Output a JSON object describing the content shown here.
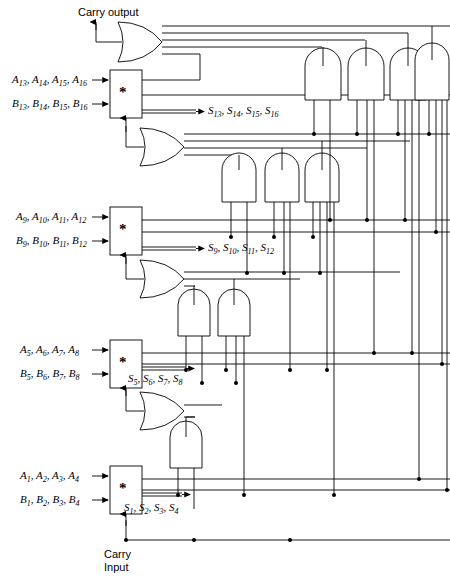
{
  "diagram": {
    "carry_output_label": "Carry output",
    "carry_input_label": "Carry\nInput",
    "carry_input_line1": "Carry",
    "carry_input_line2": "Input",
    "star_symbol": "*",
    "line_color": "#000000",
    "background_color": "#ffffff"
  },
  "stages": [
    {
      "id": "stage-4",
      "a_label": "A13, A14, A15, A16",
      "b_label": "B13, B14, B15, B16",
      "s_label": "S13, S14, S15, S16",
      "a_parts": [
        {
          "base": "A",
          "sub": "13"
        },
        {
          "base": "A",
          "sub": "14"
        },
        {
          "base": "A",
          "sub": "15"
        },
        {
          "base": "A",
          "sub": "16"
        }
      ],
      "b_parts": [
        {
          "base": "B",
          "sub": "13"
        },
        {
          "base": "B",
          "sub": "14"
        },
        {
          "base": "B",
          "sub": "15"
        },
        {
          "base": "B",
          "sub": "16"
        }
      ],
      "s_parts": [
        {
          "base": "S",
          "sub": "13"
        },
        {
          "base": "S",
          "sub": "14"
        },
        {
          "base": "S",
          "sub": "15"
        },
        {
          "base": "S",
          "sub": "16"
        }
      ],
      "or_gate_inputs": 4,
      "and_gate_count": 3
    },
    {
      "id": "stage-3",
      "a_label": "A9, A10, A11, A12",
      "b_label": "B9, B10, B11, B12",
      "s_label": "S9, S10, S11, S12",
      "a_parts": [
        {
          "base": "A",
          "sub": "9"
        },
        {
          "base": "A",
          "sub": "10"
        },
        {
          "base": "A",
          "sub": "11"
        },
        {
          "base": "A",
          "sub": "12"
        }
      ],
      "b_parts": [
        {
          "base": "B",
          "sub": "9"
        },
        {
          "base": "B",
          "sub": "10"
        },
        {
          "base": "B",
          "sub": "11"
        },
        {
          "base": "B",
          "sub": "12"
        }
      ],
      "s_parts": [
        {
          "base": "S",
          "sub": "9"
        },
        {
          "base": "S",
          "sub": "10"
        },
        {
          "base": "S",
          "sub": "11"
        },
        {
          "base": "S",
          "sub": "12"
        }
      ],
      "or_gate_inputs": 3,
      "and_gate_count": 2
    },
    {
      "id": "stage-2",
      "a_label": "A5, A6, A7, A8",
      "b_label": "B5, B6, B7, B8",
      "s_label": "S5, S6, S7, S8",
      "a_parts": [
        {
          "base": "A",
          "sub": "5"
        },
        {
          "base": "A",
          "sub": "6"
        },
        {
          "base": "A",
          "sub": "7"
        },
        {
          "base": "A",
          "sub": "8"
        }
      ],
      "b_parts": [
        {
          "base": "B",
          "sub": "5"
        },
        {
          "base": "B",
          "sub": "6"
        },
        {
          "base": "B",
          "sub": "7"
        },
        {
          "base": "B",
          "sub": "8"
        }
      ],
      "s_parts": [
        {
          "base": "S",
          "sub": "5"
        },
        {
          "base": "S",
          "sub": "6"
        },
        {
          "base": "S",
          "sub": "7"
        },
        {
          "base": "S",
          "sub": "8"
        }
      ],
      "or_gate_inputs": 2,
      "and_gate_count": 1
    },
    {
      "id": "stage-1",
      "a_label": "A1, A2, A3, A4",
      "b_label": "B1, B2, B3, B4",
      "s_label": "S1, S2, S3, S4",
      "a_parts": [
        {
          "base": "A",
          "sub": "1"
        },
        {
          "base": "A",
          "sub": "2"
        },
        {
          "base": "A",
          "sub": "3"
        },
        {
          "base": "A",
          "sub": "4"
        }
      ],
      "b_parts": [
        {
          "base": "B",
          "sub": "1"
        },
        {
          "base": "B",
          "sub": "2"
        },
        {
          "base": "B",
          "sub": "3"
        },
        {
          "base": "B",
          "sub": "4"
        }
      ],
      "s_parts": [
        {
          "base": "S",
          "sub": "1"
        },
        {
          "base": "S",
          "sub": "2"
        },
        {
          "base": "S",
          "sub": "3"
        },
        {
          "base": "S",
          "sub": "4"
        }
      ],
      "or_gate_inputs": 0,
      "and_gate_count": 0
    }
  ],
  "gates": {
    "top_or_inputs": 5,
    "and_group_top": 4,
    "and_group_mid": 3,
    "and_group_low": 2,
    "and_group_bottom": 1
  }
}
